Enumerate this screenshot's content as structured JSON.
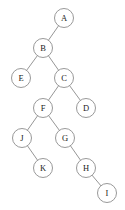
{
  "diagram": {
    "type": "binary-tree",
    "title": "",
    "background_color": "#ffffff",
    "node_fill": "#ffffff",
    "node_stroke": "#8d8d8d",
    "edge_color": "#8a8a8a",
    "label_color": "#1c1c1c",
    "node_radius": 9.5,
    "root": "A",
    "nodes": [
      {
        "id": "A",
        "label": "A",
        "x": 64,
        "y": 18
      },
      {
        "id": "B",
        "label": "B",
        "x": 43,
        "y": 48
      },
      {
        "id": "E",
        "label": "E",
        "x": 21,
        "y": 78
      },
      {
        "id": "C",
        "label": "C",
        "x": 64,
        "y": 78
      },
      {
        "id": "F",
        "label": "F",
        "x": 43,
        "y": 108
      },
      {
        "id": "D",
        "label": "D",
        "x": 86,
        "y": 108
      },
      {
        "id": "J",
        "label": "J",
        "x": 22,
        "y": 138
      },
      {
        "id": "G",
        "label": "G",
        "x": 65,
        "y": 138
      },
      {
        "id": "K",
        "label": "K",
        "x": 43,
        "y": 168
      },
      {
        "id": "H",
        "label": "H",
        "x": 86,
        "y": 168
      },
      {
        "id": "I",
        "label": "I",
        "x": 107,
        "y": 193
      }
    ],
    "edges": [
      {
        "from": "A",
        "to": "B"
      },
      {
        "from": "B",
        "to": "E"
      },
      {
        "from": "B",
        "to": "C"
      },
      {
        "from": "C",
        "to": "F"
      },
      {
        "from": "C",
        "to": "D"
      },
      {
        "from": "F",
        "to": "J"
      },
      {
        "from": "F",
        "to": "G"
      },
      {
        "from": "J",
        "to": "K"
      },
      {
        "from": "G",
        "to": "H"
      },
      {
        "from": "H",
        "to": "I"
      }
    ]
  }
}
